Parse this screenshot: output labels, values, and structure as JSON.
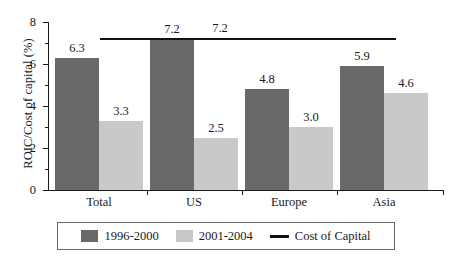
{
  "chart_data": {
    "type": "bar",
    "title": "",
    "subtitle": "",
    "xlabel": "",
    "ylabel": "ROIC/Cost of capital (%)",
    "categories": [
      "Total",
      "US",
      "Europe",
      "Asia"
    ],
    "series": [
      {
        "name": "1996-2000",
        "values": [
          6.3,
          7.2,
          4.8,
          5.9
        ],
        "color": "#696969"
      },
      {
        "name": "2001-2004",
        "values": [
          3.3,
          2.5,
          3.0,
          4.6
        ],
        "color": "#c9c9c9"
      }
    ],
    "value_labels": [
      [
        "6.3",
        "7.2",
        "4.8",
        "5.9"
      ],
      [
        "3.3",
        "2.5",
        "3.0",
        "4.6"
      ]
    ],
    "reference_line": {
      "name": "Cost of Capital",
      "value": 7.2,
      "label": "7.2",
      "color": "#111111"
    },
    "ylim": [
      0,
      8
    ],
    "ytick_values": [
      0,
      2,
      4,
      6,
      8
    ],
    "ytick_labels": [
      "0",
      "2",
      "4",
      "6",
      "8"
    ],
    "yminor_tick_values": [
      1,
      3,
      5,
      7
    ],
    "grid": false,
    "legend_position": "bottom",
    "legend": [
      {
        "label": "1996-2000",
        "marker": "swatch",
        "color": "#696969"
      },
      {
        "label": "2001-2004",
        "marker": "swatch",
        "color": "#c9c9c9"
      },
      {
        "label": "Cost of Capital",
        "marker": "line",
        "color": "#111111"
      }
    ]
  }
}
